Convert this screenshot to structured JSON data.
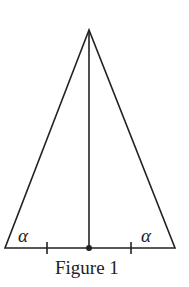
{
  "figure": {
    "caption": "Figure 1",
    "angle_label_left": "α",
    "angle_label_right": "α",
    "stroke_color": "#222222",
    "geometry": {
      "apex": [
        89,
        30
      ],
      "base_left": [
        5,
        248
      ],
      "base_right": [
        175,
        248
      ],
      "midpoint": [
        89,
        248
      ],
      "tick_left_x": 47,
      "tick_right_x": 131
    }
  }
}
